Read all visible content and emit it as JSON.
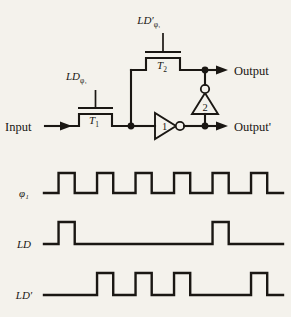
{
  "figure": {
    "type": "circuit-schematic-with-timing-diagram",
    "background_color": "#f4f2ec",
    "ink_color": "#1a1713"
  },
  "circuit": {
    "input_label": "Input",
    "output_label": "Output",
    "output_prime_label": "Output'",
    "transistors": [
      {
        "id": "T1",
        "label": "T",
        "sub": "1",
        "gate_label": "LD",
        "gate_prime": "",
        "gate_sub": "φ₁"
      },
      {
        "id": "T2",
        "label": "T",
        "sub": "2",
        "gate_label": "LD",
        "gate_prime": "′",
        "gate_sub": "φ₁"
      }
    ],
    "gate_label_t1_main": "LD",
    "gate_label_t1_sub": "φ₁",
    "gate_label_t2_main": "LD′",
    "gate_label_t2_sub": "φ₁",
    "inverters": [
      {
        "id": "inv1",
        "label": "1",
        "orientation": "right",
        "bubble": "output"
      },
      {
        "id": "inv2",
        "label": "2",
        "orientation": "up",
        "bubble": "output"
      }
    ]
  },
  "chart_data": {
    "type": "line",
    "title": "",
    "xlabel": "",
    "ylabel": "",
    "grid": false,
    "legend": "none",
    "slots": 6,
    "series": [
      {
        "name": "φ₁",
        "label": "φ₁",
        "pulses": [
          1,
          2,
          3,
          4,
          5,
          6
        ],
        "values": [
          1,
          1,
          1,
          1,
          1,
          1
        ]
      },
      {
        "name": "LD",
        "label": "LD",
        "pulses": [
          1,
          5
        ],
        "values": [
          1,
          0,
          0,
          0,
          1,
          0
        ]
      },
      {
        "name": "LD′",
        "label": "LD′",
        "pulses": [
          2,
          3,
          4,
          6
        ],
        "values": [
          0,
          1,
          1,
          1,
          0,
          1
        ]
      }
    ]
  }
}
